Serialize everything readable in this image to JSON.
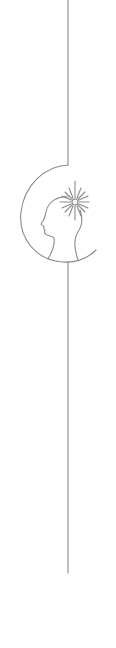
{
  "illustration": {
    "description": "Line-art vertical ornament: thin line interrupted by a crescent arc framing a left-facing head silhouette with a radiant star at the crown",
    "stroke_color": "#8a8a8a",
    "background_color": "#ffffff",
    "elements": [
      "top-vertical-line",
      "crescent-arc",
      "head-profile",
      "radiant-star",
      "bottom-vertical-line"
    ]
  }
}
